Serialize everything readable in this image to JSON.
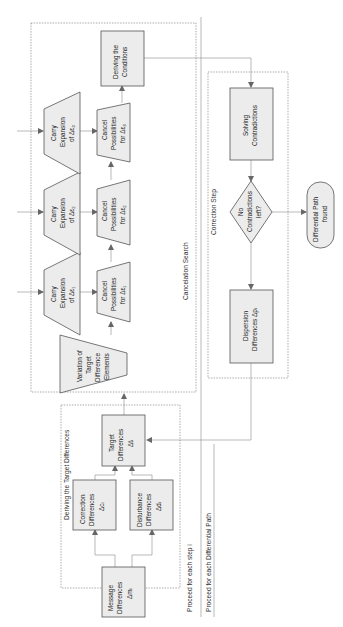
{
  "diagram": {
    "containers": {
      "target_differences": {
        "label": "Deriving the Target Differences"
      },
      "cancelation_search": {
        "label": "Cancelation Search"
      },
      "correction_step": {
        "label": "Correction Step"
      }
    },
    "loops": {
      "step": "Proceed for each step i",
      "path": "Proceed for each Differential Path"
    },
    "nodes": {
      "message": [
        "Message",
        "Differences",
        "Δmᵢ"
      ],
      "correction": [
        "Correction",
        "Differences",
        "Δcᵢ"
      ],
      "disturbance": [
        "Disturbance",
        "Differences",
        "Δdᵢ"
      ],
      "target": [
        "Target",
        "Differences",
        "Δtᵢ"
      ],
      "variation": [
        "Variation of",
        "Target",
        "Difference",
        "Elements"
      ],
      "carry1": [
        "Carry",
        "Expansion",
        "of Δε₁"
      ],
      "carry2": [
        "Carry",
        "Expansion",
        "of Δε₂"
      ],
      "carry3": [
        "Carry",
        "Expansion",
        "of Δε₃"
      ],
      "cancel1": [
        "Cancel",
        "Possibilities",
        "for Δε₁"
      ],
      "cancel2": [
        "Cancel",
        "Possibilities",
        "for Δε₂"
      ],
      "cancel3": [
        "Cancel",
        "Possibilities",
        "for Δε₃"
      ],
      "conditions": [
        "Deriving the",
        "Conditions"
      ],
      "solving": [
        "Solving",
        "Contradictions"
      ],
      "decision": [
        "No",
        "Contradictions",
        "left?"
      ],
      "dispersion": [
        "Dispersion",
        "Differences Δpᵢ"
      ],
      "result": [
        "Differential Path",
        "found"
      ]
    },
    "colors": {
      "fill": "#ececec",
      "stroke": "#555555",
      "connector": "#8a8a8a"
    }
  }
}
